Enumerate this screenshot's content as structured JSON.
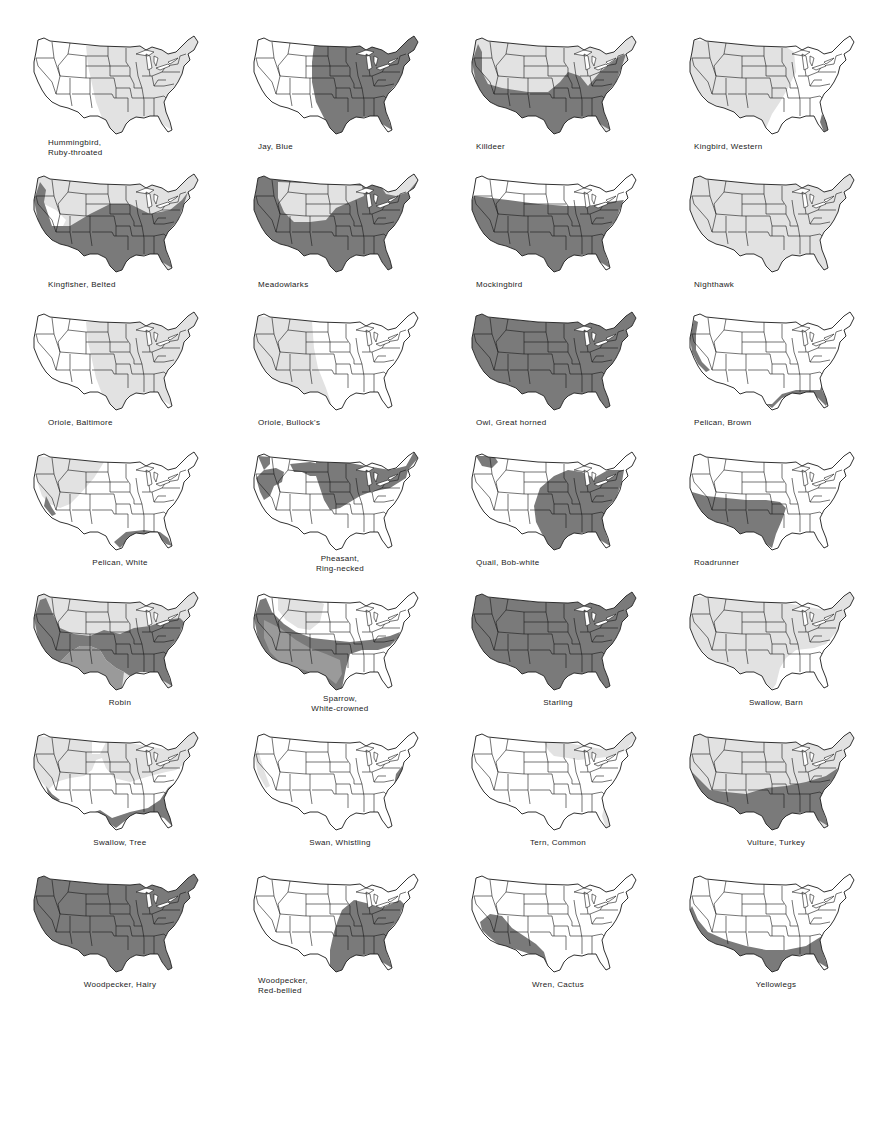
{
  "colors": {
    "dark_range": "#7a7a7a",
    "light_range": "#e2e2e2",
    "land": "#ffffff",
    "border": "#1a1a1a"
  },
  "maps": [
    {
      "label": "Hummingbird,\nRuby-throated",
      "lines": [
        "Hummingbird,",
        "Ruby-throated"
      ],
      "align": "left",
      "range": "light_east"
    },
    {
      "label": "Jay, Blue",
      "lines": [
        "Jay, Blue"
      ],
      "align": "left",
      "range": "dark_east"
    },
    {
      "label": "Killdeer",
      "lines": [
        "Killdeer"
      ],
      "align": "left",
      "range": "killdeer"
    },
    {
      "label": "Kingbird, Western",
      "lines": [
        "Kingbird, Western"
      ],
      "align": "left",
      "range": "light_west"
    },
    {
      "label": "Kingfisher, Belted",
      "lines": [
        "Kingfisher, Belted"
      ],
      "align": "left",
      "range": "kingfisher"
    },
    {
      "label": "Meadowlarks",
      "lines": [
        "Meadowlarks"
      ],
      "align": "left",
      "range": "meadowlarks"
    },
    {
      "label": "Mockingbird",
      "lines": [
        "Mockingbird"
      ],
      "align": "left",
      "range": "mockingbird"
    },
    {
      "label": "Nighthawk",
      "lines": [
        "Nighthawk"
      ],
      "align": "left",
      "range": "light_all"
    },
    {
      "label": "Oriole, Baltimore",
      "lines": [
        "Oriole, Baltimore"
      ],
      "align": "left",
      "range": "light_east"
    },
    {
      "label": "Oriole, Bullock's",
      "lines": [
        "Oriole, Bullock's"
      ],
      "align": "left",
      "range": "light_west_only"
    },
    {
      "label": "Owl, Great horned",
      "lines": [
        "Owl, Great horned"
      ],
      "align": "left",
      "range": "dark_all"
    },
    {
      "label": "Pelican, Brown",
      "lines": [
        "Pelican, Brown"
      ],
      "align": "left",
      "range": "coast"
    },
    {
      "label": "Pelican, White",
      "lines": [
        "Pelican, White"
      ],
      "align": "center",
      "range": "pelican_white"
    },
    {
      "label": "Pheasant,\nRing-necked",
      "lines": [
        "Pheasant,",
        "Ring-necked"
      ],
      "align": "center",
      "range": "pheasant"
    },
    {
      "label": "Quail, Bob-white",
      "lines": [
        "Quail, Bob-white"
      ],
      "align": "left",
      "range": "quail"
    },
    {
      "label": "Roadrunner",
      "lines": [
        "Roadrunner"
      ],
      "align": "left",
      "range": "roadrunner"
    },
    {
      "label": "Robin",
      "lines": [
        "Robin"
      ],
      "align": "center",
      "range": "robin"
    },
    {
      "label": "Sparrow,\nWhite-crowned",
      "lines": [
        "Sparrow,",
        "White-crowned"
      ],
      "align": "center",
      "range": "sparrow"
    },
    {
      "label": "Starling",
      "lines": [
        "Starling"
      ],
      "align": "center",
      "range": "dark_all"
    },
    {
      "label": "Swallow, Barn",
      "lines": [
        "Swallow, Barn"
      ],
      "align": "center",
      "range": "swallow_barn"
    },
    {
      "label": "Swallow, Tree",
      "lines": [
        "Swallow, Tree"
      ],
      "align": "center",
      "range": "swallow_tree"
    },
    {
      "label": "Swan, Whistling",
      "lines": [
        "Swan, Whistling"
      ],
      "align": "center",
      "range": "swan"
    },
    {
      "label": "Tern, Common",
      "lines": [
        "Tern, Common"
      ],
      "align": "center",
      "range": "tern"
    },
    {
      "label": "Vulture, Turkey",
      "lines": [
        "Vulture, Turkey"
      ],
      "align": "center",
      "range": "vulture"
    },
    {
      "label": "Woodpecker, Hairy",
      "lines": [
        "Woodpecker, Hairy"
      ],
      "align": "center",
      "range": "dark_all"
    },
    {
      "label": "Woodpecker,\nRed-bellied",
      "lines": [
        "Woodpecker,",
        "Red-bellied"
      ],
      "align": "left",
      "range": "woodpecker_rb"
    },
    {
      "label": "Wren, Cactus",
      "lines": [
        "Wren, Cactus"
      ],
      "align": "center",
      "range": "wren"
    },
    {
      "label": "Yellowlegs",
      "lines": [
        "Yellowlegs"
      ],
      "align": "center",
      "range": "yellowlegs"
    }
  ]
}
